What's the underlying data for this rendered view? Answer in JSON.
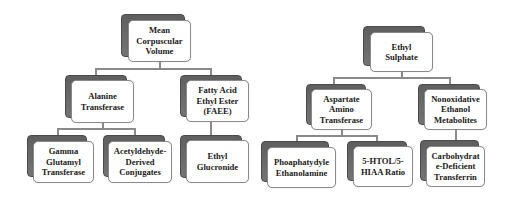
{
  "diagram": {
    "type": "hierarchy",
    "left_tree": {
      "root": {
        "label": "Mean\nCorpuscular\nVolume"
      },
      "level2": [
        {
          "label": "Alanine\nTransferase"
        },
        {
          "label": "Fatty Acid\nEthyl Ester\n(FAEE)"
        }
      ],
      "level3": [
        {
          "label": "Gamma\nGlutamyl\nTransferase",
          "parent": "Alanine Transferase"
        },
        {
          "label": "Acetyldehyde-\nDerived\nConjugates",
          "parent": "Alanine Transferase"
        },
        {
          "label": "Ethyl\nGlucronide",
          "parent": "Fatty Acid Ethyl Ester (FAEE)"
        }
      ]
    },
    "right_tree": {
      "root": {
        "label": "Ethyl\nSulphate"
      },
      "level2": [
        {
          "label": "Aspartate\nAmino\nTransferase"
        },
        {
          "label": "Nonoxidative\nEthanol\nMetabolites"
        }
      ],
      "level3": [
        {
          "label": "Phoaphatydyle\nEthanolamine",
          "parent": "Aspartate Amino Transferase"
        },
        {
          "label": "5-HTOL/5-\nHIAA Ratio",
          "parent": "Aspartate Amino Transferase"
        },
        {
          "label": "Carbohydrat\ne-Deficient\nTransferrin",
          "parent": "Nonoxidative Ethanol Metabolites"
        }
      ]
    },
    "colors": {
      "shadow": "#6b6b6b",
      "border": "#8a8a8a",
      "fill": "#ffffff",
      "text": "#1a1a1a",
      "connector": "#8a8a8a"
    }
  }
}
